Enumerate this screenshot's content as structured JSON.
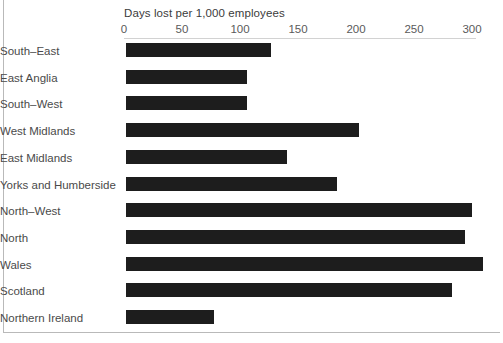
{
  "chart_data": {
    "type": "bar",
    "orientation": "horizontal",
    "title": "Days lost per 1,000 employees",
    "xlabel": "Days lost per 1,000 employees",
    "ylabel": "",
    "xlim": [
      0,
      310
    ],
    "xticks": [
      0,
      50,
      100,
      150,
      200,
      250,
      300
    ],
    "xtick_labels": [
      "0",
      "50",
      "100",
      "150",
      "200",
      "250",
      "300"
    ],
    "grid": false,
    "legend": null,
    "bar_color": "#1d1d1d",
    "categories": [
      "South–East",
      "East Anglia",
      "South–West",
      "West Midlands",
      "East Midlands",
      "Yorks and Humberside",
      "North–West",
      "North",
      "Wales",
      "Scotland",
      "Northern Ireland"
    ],
    "values": [
      125,
      104,
      104,
      201,
      139,
      182,
      298,
      292,
      308,
      281,
      76
    ]
  },
  "axis": {
    "title": "Days lost per 1,000 employees"
  }
}
